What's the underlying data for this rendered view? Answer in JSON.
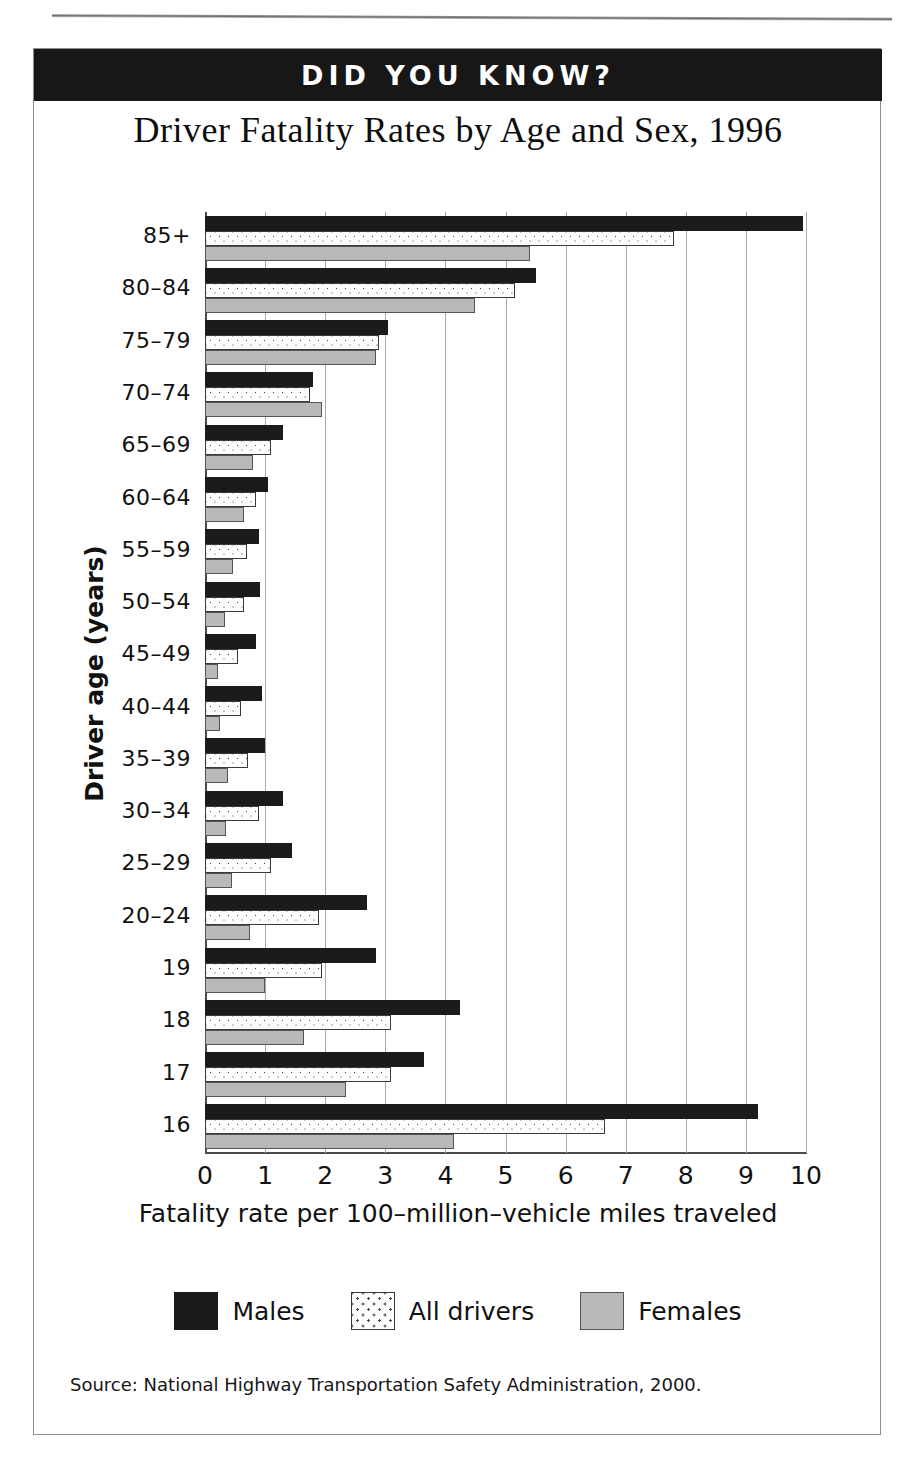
{
  "page": {
    "running_head": "",
    "banner_label": "DID YOU KNOW?"
  },
  "source_note": "Source:  National Highway Transportation Safety Administration, 2000.",
  "legend": {
    "items": [
      {
        "label": "Males",
        "swatch": "solid-black-swatch",
        "color": "#1b1b1b"
      },
      {
        "label": "All drivers",
        "swatch": "dotted-white-swatch",
        "color": "#fdfdfd"
      },
      {
        "label": "Females",
        "swatch": "solid-gray-swatch",
        "color": "#b9b9b9"
      }
    ]
  },
  "chart_data": {
    "type": "bar",
    "orientation": "horizontal",
    "title": "Driver Fatality Rates by Age and Sex, 1996",
    "xlabel": "Fatality rate per 100–million–vehicle miles traveled",
    "ylabel": "Driver age (years)",
    "xlim": [
      0,
      10
    ],
    "xticks": [
      0,
      1,
      2,
      3,
      4,
      5,
      6,
      7,
      8,
      9,
      10
    ],
    "xtick_labels": [
      "0",
      "1",
      "2",
      "3",
      "4",
      "5",
      "6",
      "7",
      "8",
      "9",
      "10"
    ],
    "grid": "vertical",
    "legend_position": "bottom",
    "categories": [
      "85+",
      "80–84",
      "75–79",
      "70–74",
      "65–69",
      "60–64",
      "55–59",
      "50–54",
      "45–49",
      "40–44",
      "35–39",
      "30–34",
      "25–29",
      "20–24",
      "19",
      "18",
      "17",
      "16"
    ],
    "series": [
      {
        "name": "Males",
        "color": "#1b1b1b",
        "values": [
          9.95,
          5.5,
          3.05,
          1.8,
          1.3,
          1.05,
          0.9,
          0.92,
          0.85,
          0.95,
          1.0,
          1.3,
          1.45,
          2.7,
          2.85,
          4.25,
          3.65,
          9.2
        ]
      },
      {
        "name": "All drivers",
        "color": "#fdfdfd",
        "values": [
          7.8,
          5.15,
          2.9,
          1.75,
          1.1,
          0.85,
          0.7,
          0.65,
          0.55,
          0.6,
          0.72,
          0.9,
          1.1,
          1.9,
          1.95,
          3.1,
          3.1,
          6.65
        ]
      },
      {
        "name": "Females",
        "color": "#b9b9b9",
        "values": [
          5.4,
          4.5,
          2.85,
          1.95,
          0.8,
          0.65,
          0.47,
          0.33,
          0.22,
          0.25,
          0.38,
          0.35,
          0.45,
          0.75,
          1.0,
          1.65,
          2.35,
          4.15
        ]
      }
    ]
  }
}
